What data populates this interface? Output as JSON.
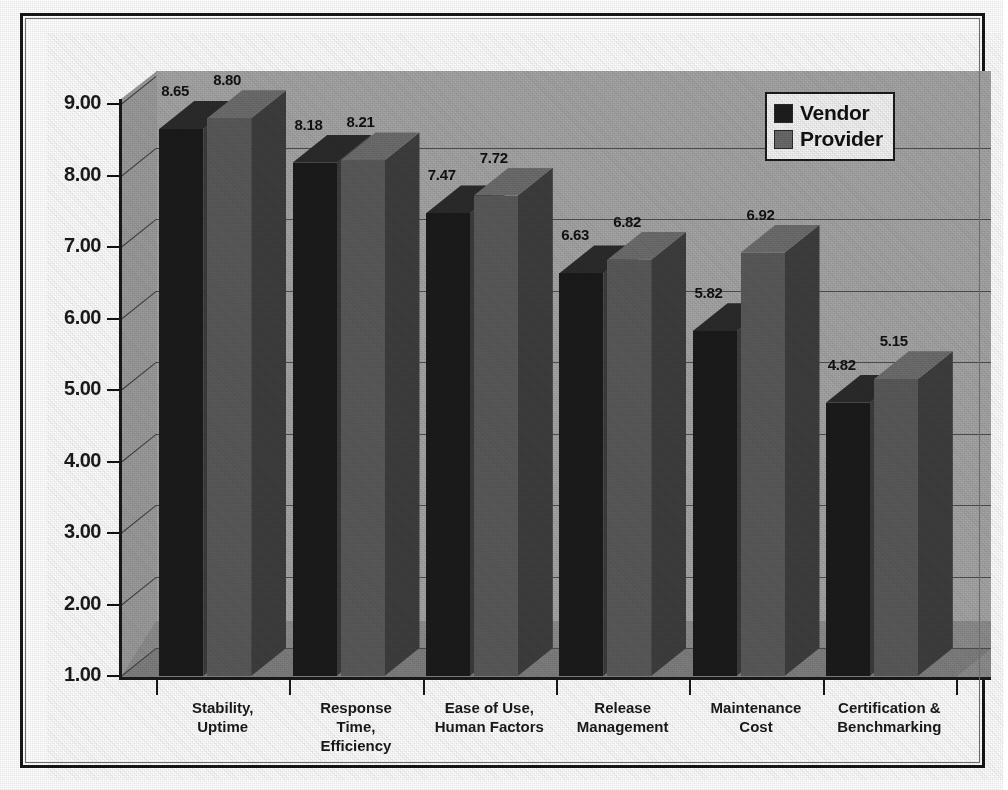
{
  "chart_data": {
    "type": "bar",
    "title": "",
    "subtitle": "",
    "xlabel": "",
    "ylabel": "",
    "categories": [
      "Stability,\nUptime",
      "Response\nTime,\nEfficiency",
      "Ease of Use,\nHuman Factors",
      "Release\nManagement",
      "Maintenance\nCost",
      "Certification &\nBenchmarking"
    ],
    "series": [
      {
        "name": "Vendor",
        "values": [
          8.65,
          8.18,
          7.47,
          6.63,
          5.82,
          4.82
        ],
        "color": "#1b1b1b"
      },
      {
        "name": "Provider",
        "values": [
          8.8,
          8.21,
          7.72,
          6.82,
          6.92,
          5.15
        ],
        "color": "#5a5a5a"
      }
    ],
    "data_labels": [
      "8.65",
      "8.80",
      "8.18",
      "8.21",
      "7.47",
      "7.72",
      "6.63",
      "6.82",
      "5.82",
      "6.92",
      "4.82",
      "5.15"
    ],
    "ylim": [
      1.0,
      9.0
    ],
    "ytick_step": 1.0,
    "ytick_labels": [
      "9.00",
      "8.00",
      "7.00",
      "6.00",
      "5.00",
      "4.00",
      "3.00",
      "2.00",
      "1.00"
    ],
    "ytick_values": [
      9.0,
      8.0,
      7.0,
      6.0,
      5.0,
      4.0,
      3.0,
      2.0,
      1.0
    ],
    "grid": true,
    "grid_axis": "y",
    "legend": true,
    "legend_position": "top-right",
    "three_d": true,
    "plot_background": "#a5a5a5",
    "gridline_color": "#4d4d4d"
  },
  "axis": {
    "y_labels": [
      "9.00",
      "8.00",
      "7.00",
      "6.00",
      "5.00",
      "4.00",
      "3.00",
      "2.00",
      "1.00"
    ],
    "x_labels": [
      {
        "line1": "Stability,",
        "line2": "Uptime",
        "line3": ""
      },
      {
        "line1": "Response",
        "line2": "Time,",
        "line3": "Efficiency"
      },
      {
        "line1": "Ease of Use,",
        "line2": "Human Factors",
        "line3": ""
      },
      {
        "line1": "Release",
        "line2": "Management",
        "line3": ""
      },
      {
        "line1": "Maintenance",
        "line2": "Cost",
        "line3": ""
      },
      {
        "line1": "Certification &",
        "line2": "Benchmarking",
        "line3": ""
      }
    ]
  },
  "legend": {
    "items": [
      {
        "label": "Vendor",
        "color": "#1d1d1d"
      },
      {
        "label": "Provider",
        "color": "#6a6a6a"
      }
    ]
  },
  "bar_labels": {
    "g0": {
      "vendor": "8.65",
      "provider": "8.80"
    },
    "g1": {
      "vendor": "8.18",
      "provider": "8.21"
    },
    "g2": {
      "vendor": "7.47",
      "provider": "7.72"
    },
    "g3": {
      "vendor": "6.63",
      "provider": "6.82"
    },
    "g4": {
      "vendor": "5.82",
      "provider": "6.92"
    },
    "g5": {
      "vendor": "4.82",
      "provider": "5.15"
    }
  }
}
